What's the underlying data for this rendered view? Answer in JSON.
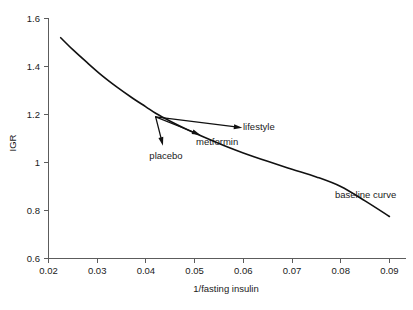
{
  "chart_data": {
    "type": "line",
    "title": "",
    "xlabel": "1/fasting insulin",
    "ylabel": "IGR",
    "xlim": [
      0.02,
      0.0935
    ],
    "ylim": [
      0.6,
      1.6
    ],
    "grid": false,
    "legend": "none",
    "xticks": [
      "0.02",
      "0.03",
      "0.04",
      "0.05",
      "0.06",
      "0.07",
      "0.08",
      "0.09"
    ],
    "xtick_values": [
      0.02,
      0.03,
      0.04,
      0.05,
      0.06,
      0.07,
      0.08,
      0.09
    ],
    "yticks": [
      "0.6",
      "0.8",
      "1",
      "1.2",
      "1.4",
      "1.6"
    ],
    "ytick_values": [
      0.6,
      0.8,
      1.0,
      1.2,
      1.4,
      1.6
    ],
    "series": [
      {
        "name": "baseline curve",
        "label": "baseline curve",
        "x": [
          0.0225,
          0.025,
          0.028,
          0.031,
          0.034,
          0.037,
          0.04,
          0.042,
          0.045,
          0.048,
          0.052,
          0.056,
          0.06,
          0.065,
          0.07,
          0.075,
          0.08,
          0.085,
          0.09
        ],
        "y": [
          1.52,
          1.47,
          1.415,
          1.362,
          1.315,
          1.272,
          1.232,
          1.205,
          1.172,
          1.142,
          1.105,
          1.071,
          1.04,
          1.005,
          0.972,
          0.94,
          0.9,
          0.84,
          0.775
        ]
      }
    ],
    "annotations": [
      {
        "label": "placebo",
        "from_x": 0.042,
        "from_y": 1.19,
        "to_x": 0.0435,
        "to_y": 1.07,
        "label_x": 0.0435,
        "label_y": 1.035
      },
      {
        "label": "metformin",
        "from_x": 0.042,
        "from_y": 1.19,
        "to_x": 0.0512,
        "to_y": 1.115,
        "label_x": 0.0545,
        "label_y": 1.075
      },
      {
        "label": "lifestyle",
        "from_x": 0.042,
        "from_y": 1.19,
        "to_x": 0.0598,
        "to_y": 1.145,
        "label_x": 0.0615,
        "label_y": 1.145
      },
      {
        "label": "baseline curve",
        "label_x": 0.0755,
        "label_y": 0.875
      }
    ],
    "colors": {
      "curve": "#111111",
      "axis": "#5c5c5c",
      "text": "#1a1a1a",
      "background": "#ffffff"
    }
  }
}
